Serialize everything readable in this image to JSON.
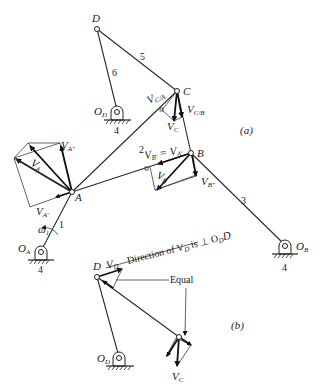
{
  "figure": {
    "part_a_label": "(a)",
    "part_b_label": "(b)"
  },
  "joints": {
    "D": "D",
    "C": "C",
    "B": "B",
    "A": "A",
    "O_D": "O",
    "O_D_sub": "D",
    "O_A": "O",
    "O_A_sub": "A",
    "O_B": "O",
    "O_B_sub": "B"
  },
  "links": {
    "link1": "1",
    "link2": "2",
    "link3": "3",
    "link5": "5",
    "link6": "6",
    "ground_OD": "4",
    "ground_OA": "4",
    "ground_OB": "4"
  },
  "vectors": {
    "omega1": "ω",
    "omega1_sub": "1",
    "VA": "V",
    "VA_sub": "A",
    "VA_prime": "V",
    "VA_prime_sub": "A'",
    "VA_dprime": "V",
    "VA_dprime_sub": "A\"",
    "VB": "V",
    "VB_sub": "B",
    "VB_prime_eq": "V",
    "VB_prime_eq_sub": "B'",
    "VB_eq_sign": " = V",
    "VB_eq_rhs_sub": "A'",
    "VB_dprime": "V",
    "VB_dprime_sub": "B\"",
    "VC": "V",
    "VC_sub": "C",
    "VCA": "V",
    "VCA_sub": "C/A",
    "VCB": "V",
    "VCB_sub": "C/B"
  },
  "part_b": {
    "D": "D",
    "VD": "V",
    "VD_sub": "D",
    "direction_text_1": "Direction of V",
    "direction_text_sub1": "D",
    "direction_text_2": " is ⊥ O",
    "direction_text_sub2": "D",
    "direction_text_3": "D",
    "equal": "Equal",
    "O_D": "O",
    "O_D_sub": "D",
    "VC": "V",
    "VC_sub": "C"
  }
}
